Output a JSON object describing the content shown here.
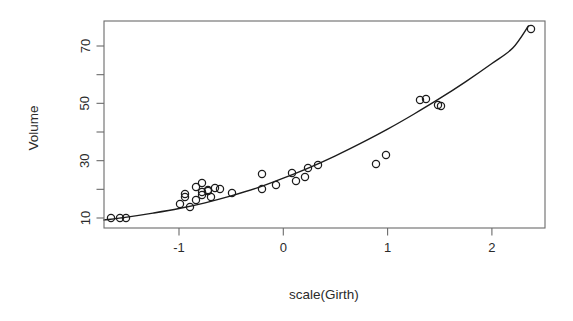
{
  "chart_data": {
    "type": "scatter",
    "title": "",
    "subtitle": "",
    "xlabel": "scale(Girth)",
    "ylabel": "Volume",
    "xlim": [
      -1.72,
      2.52
    ],
    "ylim": [
      7.2,
      78.5
    ],
    "grid": false,
    "legend": null,
    "x_ticks": [
      -1,
      0,
      1,
      2
    ],
    "x_tick_labels": [
      "-1",
      "0",
      "1",
      "2"
    ],
    "x_minor_ticks": [
      -1.5,
      -0.5,
      0.5,
      1.5
    ],
    "y_ticks": [
      10,
      30,
      50,
      70
    ],
    "y_tick_labels": [
      "10",
      "30",
      "50",
      "70"
    ],
    "y_minor_ticks": [
      20,
      40,
      60
    ],
    "point_marker": "open-circle",
    "point_color": "#1c1c1c",
    "curve_color": "#1c1c1c",
    "n_points": 31,
    "x": [
      -1.58,
      -1.49,
      -1.43,
      -0.91,
      -0.86,
      -0.86,
      -0.81,
      -0.75,
      -0.75,
      -0.69,
      -0.69,
      -0.69,
      -0.63,
      -0.63,
      -0.6,
      -0.57,
      -0.52,
      -0.4,
      -0.11,
      -0.11,
      0.02,
      0.16,
      0.19,
      0.28,
      0.31,
      0.4,
      0.89,
      0.98,
      1.32,
      1.38,
      1.5,
      1.53,
      2.33
    ],
    "y": [
      10.3,
      10.3,
      10.2,
      16.4,
      18.8,
      19.7,
      15.6,
      18.2,
      22.6,
      19.9,
      24.2,
      21.0,
      21.4,
      21.3,
      19.1,
      22.2,
      33.8,
      27.4,
      25.7,
      24.9,
      34.5,
      31.7,
      36.3,
      38.3,
      42.6,
      55.4,
      55.7,
      58.3,
      51.5,
      51.0,
      77.0
    ],
    "curve_description": "fitted smooth (quadratic) regression line of Volume on scale(Girth)",
    "curve_points": [
      [
        -1.72,
        9.3
      ],
      [
        -1.5,
        10.3
      ],
      [
        -1.25,
        11.7
      ],
      [
        -1.0,
        13.3
      ],
      [
        -0.75,
        15.3
      ],
      [
        -0.5,
        17.7
      ],
      [
        -0.25,
        20.5
      ],
      [
        0.0,
        23.9
      ],
      [
        0.25,
        27.6
      ],
      [
        0.5,
        31.7
      ],
      [
        0.75,
        36.2
      ],
      [
        1.0,
        41.0
      ],
      [
        1.25,
        46.2
      ],
      [
        1.5,
        51.7
      ],
      [
        1.75,
        57.6
      ],
      [
        2.0,
        63.9
      ],
      [
        2.2,
        69.3
      ],
      [
        2.35,
        77.0
      ]
    ]
  },
  "points_px": {
    "note": "rendered marker centers in screenshot pixel space",
    "list": [
      [
        111,
        218
      ],
      [
        120,
        218
      ],
      [
        126,
        218
      ],
      [
        180,
        204
      ],
      [
        185,
        197
      ],
      [
        185,
        194
      ],
      [
        190,
        207
      ],
      [
        196,
        200
      ],
      [
        196,
        187
      ],
      [
        202,
        195
      ],
      [
        202,
        183
      ],
      [
        202,
        192
      ],
      [
        208,
        190
      ],
      [
        208,
        191
      ],
      [
        211,
        197
      ],
      [
        215,
        188
      ],
      [
        220,
        189
      ],
      [
        232,
        193
      ],
      [
        262,
        174
      ],
      [
        262,
        189
      ],
      [
        276,
        185
      ],
      [
        292,
        173
      ],
      [
        296,
        181
      ],
      [
        305,
        177
      ],
      [
        308,
        168
      ],
      [
        318,
        165
      ],
      [
        376,
        164
      ],
      [
        386,
        155
      ],
      [
        420,
        100
      ],
      [
        426,
        99
      ],
      [
        438,
        105
      ],
      [
        441,
        106
      ],
      [
        531,
        29
      ]
    ]
  },
  "axes_px": {
    "plot_left": 104,
    "plot_right": 545,
    "plot_top": 21,
    "plot_bottom": 228,
    "x_zero_px": 283.3,
    "x_unit_px": 104.3,
    "y_ten_px": 218,
    "y_unit_px": 2.8667
  },
  "labels": {
    "y_axis_title": "Volume",
    "x_axis_title": "scale(Girth)"
  }
}
